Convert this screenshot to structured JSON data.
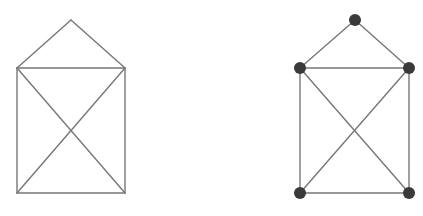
{
  "canvas": {
    "width": 423,
    "height": 216,
    "background": "#ffffff"
  },
  "style": {
    "edge_color": "#777777",
    "edge_width": 1.4,
    "node_color": "#3a3a3a",
    "node_radius": 6
  },
  "figures": [
    {
      "id": "house-graph-plain",
      "show_nodes": false,
      "nodes": [
        {
          "id": "apex",
          "x": 71,
          "y": 20
        },
        {
          "id": "top-left",
          "x": 17,
          "y": 68
        },
        {
          "id": "top-right",
          "x": 125,
          "y": 68
        },
        {
          "id": "bottom-left",
          "x": 17,
          "y": 193
        },
        {
          "id": "bottom-right",
          "x": 125,
          "y": 193
        }
      ],
      "edges": [
        [
          "apex",
          "top-left"
        ],
        [
          "apex",
          "top-right"
        ],
        [
          "top-left",
          "top-right"
        ],
        [
          "top-left",
          "bottom-left"
        ],
        [
          "top-right",
          "bottom-right"
        ],
        [
          "bottom-left",
          "bottom-right"
        ],
        [
          "top-left",
          "bottom-right"
        ],
        [
          "top-right",
          "bottom-left"
        ]
      ]
    },
    {
      "id": "house-graph-with-vertices",
      "show_nodes": true,
      "nodes": [
        {
          "id": "apex",
          "x": 355,
          "y": 20
        },
        {
          "id": "top-left",
          "x": 300,
          "y": 68
        },
        {
          "id": "top-right",
          "x": 409,
          "y": 68
        },
        {
          "id": "bottom-left",
          "x": 300,
          "y": 193
        },
        {
          "id": "bottom-right",
          "x": 409,
          "y": 193
        }
      ],
      "edges": [
        [
          "apex",
          "top-left"
        ],
        [
          "apex",
          "top-right"
        ],
        [
          "top-left",
          "top-right"
        ],
        [
          "top-left",
          "bottom-left"
        ],
        [
          "top-right",
          "bottom-right"
        ],
        [
          "bottom-left",
          "bottom-right"
        ],
        [
          "top-left",
          "bottom-right"
        ],
        [
          "top-right",
          "bottom-left"
        ]
      ]
    }
  ]
}
